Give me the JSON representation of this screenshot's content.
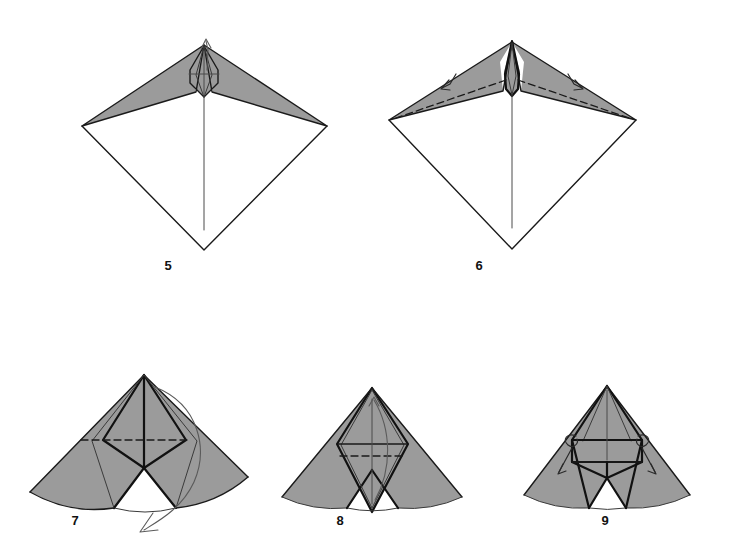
{
  "page": {
    "background_color": "#ffffff",
    "width": 744,
    "height": 545
  },
  "palette": {
    "paper_front": "#ffffff",
    "paper_back": "#9b9b9b",
    "ink": "#1a1a1a",
    "crease": "#4a4a4a",
    "arrow": "#5a5a5a"
  },
  "figures": [
    {
      "id": "figure-5",
      "number": "5",
      "row": "top",
      "label_x": 168,
      "label_y": 270,
      "description": "Kite base with wide grey wing flaps spread left and right from a narrow central point; small arrow at top points up.",
      "arrows": [
        {
          "name": "unfold-up-arrow",
          "kind": "straight",
          "direction": "up"
        }
      ],
      "creases": [
        "horizontal valley through small diamond",
        "vertical centre line"
      ]
    },
    {
      "id": "figure-6",
      "number": "6",
      "row": "top",
      "label_x": 479,
      "label_y": 270,
      "description": "Same kite shape with long dashed mountain creases running out along each grey wing toward the side corners; two small fold arrows sit on the wings.",
      "arrows": [
        {
          "name": "fold-left-wing-arrow",
          "kind": "small-hook",
          "direction": "down-left"
        },
        {
          "name": "fold-right-wing-arrow",
          "kind": "small-hook",
          "direction": "down-right"
        }
      ],
      "creases": [
        "dashed mountain fold left wing",
        "dashed mountain fold right wing",
        "vertical centre line"
      ]
    },
    {
      "id": "figure-7",
      "number": "7",
      "row": "bottom",
      "label_x": 75,
      "label_y": 525,
      "description": "Grey fan-shaped form with concave arc bottom and a tall narrow central spike; a dashed horizontal crease crosses the inner diamond and a large curved arrow sweeps from top right down around to the bottom.",
      "arrows": [
        {
          "name": "fold-over-sweep-arrow",
          "kind": "large-curve",
          "direction": "clockwise-down"
        }
      ],
      "creases": [
        "dashed horizontal crease across inner diamond",
        "vertical mountain spine"
      ]
    },
    {
      "id": "figure-8",
      "number": "8",
      "row": "bottom",
      "label_x": 340,
      "label_y": 525,
      "description": "Grey fan form with a large central diamond containing a solid horizontal crease above a dashed horizontal crease, a vertical line, and a slim curved arrow inside the diamond.",
      "arrows": [
        {
          "name": "inner-fold-arrow",
          "kind": "slim-curve",
          "direction": "up"
        }
      ],
      "creases": [
        "solid horizontal crease",
        "dashed horizontal crease",
        "vertical crease"
      ]
    },
    {
      "id": "figure-9",
      "number": "9",
      "row": "bottom",
      "label_x": 605,
      "label_y": 525,
      "description": "Grey fan form with narrow central panel framed by lines running to the apex; two small looped curl arrows point outward and down from the upper corners of the inner rectangle.",
      "arrows": [
        {
          "name": "curl-left-arrow",
          "kind": "loop",
          "direction": "down-left"
        },
        {
          "name": "curl-right-arrow",
          "kind": "loop",
          "direction": "down-right"
        }
      ],
      "creases": [
        "horizontal crease across inner panel",
        "vertical centre crease",
        "radial fold lines to apex"
      ]
    }
  ]
}
